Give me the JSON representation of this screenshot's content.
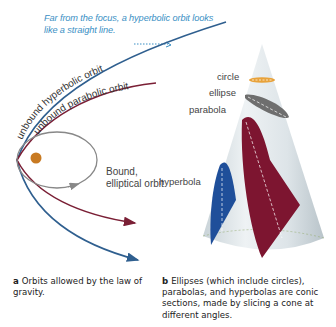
{
  "panel_a": {
    "annotation": "Far from the focus, a hyperbolic orbit looks like a straight line.",
    "labels": {
      "hyperbolic": "unbound hyperbolic orbit",
      "parabolic": "unbound parabolic orbit",
      "elliptical": "Bound, elliptical orbit"
    },
    "caption_letter": "a",
    "caption_text": "Orbits allowed by the law of gravity."
  },
  "panel_b": {
    "labels": {
      "circle": "circle",
      "ellipse": "ellipse",
      "parabola": "parabola",
      "hyperbola": "hyperbola"
    },
    "caption_letter": "b",
    "caption_text": "Ellipses (which include circles), parabolas, and hyperbolas are conic sections, made by slicing a cone at different angles."
  },
  "colors": {
    "hyperbolic": "#2f5f8f",
    "parabolic": "#7a1f35",
    "elliptical": "#888888",
    "focus": "#c87a22",
    "annotation": "#3a8fc4",
    "cone": "#dfe6ea",
    "circle_section": "#e8a23a",
    "ellipse_section": "#6e6e6e",
    "parabola_section": "#7d1530",
    "hyperbola_section": "#1f4f9a"
  }
}
